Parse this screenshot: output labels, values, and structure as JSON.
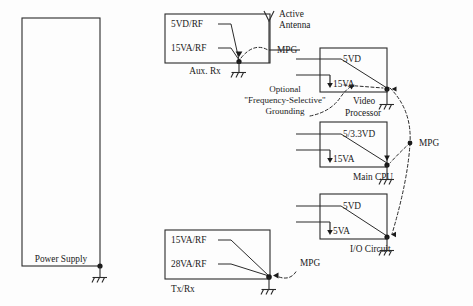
{
  "diagram": {
    "background_color": "#fdfdfd",
    "line_color": "#2b2b2b",
    "blocks": [
      {
        "id": "power-supply",
        "label": "Power Supply",
        "rails": [],
        "ground": "chassis-ground"
      },
      {
        "id": "aux-rx",
        "label": "Aux. Rx",
        "rails": [
          "5VD/RF",
          "15VA/RF"
        ],
        "ground": "chassis-ground"
      },
      {
        "id": "video-processor",
        "label_line1": "Video",
        "label_line2": "Processor",
        "label": "Video Processor",
        "rails": [
          "5VD",
          "15VA"
        ],
        "ground": "chassis-ground"
      },
      {
        "id": "main-cpu",
        "label": "Main CPU",
        "rails": [
          "5/3.3VD",
          "15VA"
        ],
        "ground": "chassis-ground"
      },
      {
        "id": "io-circuit",
        "label": "I/O Circuit",
        "rails": [
          "5VD",
          "5VA"
        ],
        "ground": "chassis-ground"
      },
      {
        "id": "tx-rx",
        "label": "Tx/Rx",
        "rails": [
          "15VA/RF",
          "28VA/RF"
        ],
        "ground": "chassis-ground"
      }
    ],
    "antenna": {
      "label_line1": "Active",
      "label_line2": "Antenna",
      "label": "Active Antenna"
    },
    "mpg_labels": [
      {
        "id": "mpg-antenna",
        "text": "MPG"
      },
      {
        "id": "mpg-right",
        "text": "MPG"
      },
      {
        "id": "mpg-txrx",
        "text": "MPG"
      }
    ],
    "note": {
      "line1": "Optional",
      "line2": "\"Frequency-Selective\"",
      "line3": "Grounding",
      "text": "Optional \"Frequency-Selective\" Grounding"
    }
  }
}
